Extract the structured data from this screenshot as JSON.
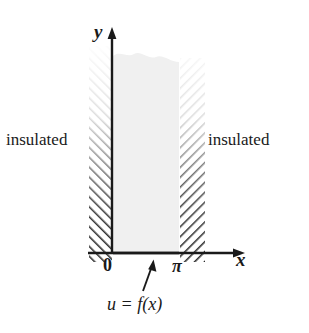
{
  "figure": {
    "labels": {
      "insulated_left": "insulated",
      "insulated_right": "insulated",
      "y_axis": "y",
      "x_axis": "x",
      "origin": "0",
      "pi": "π",
      "boundary_condition": "u = f(x)"
    },
    "colors": {
      "background": "#ffffff",
      "ink": "#1a1a1a",
      "region_fill": "#f0f0f0",
      "hatch": "#2a2a2a"
    },
    "geometry": {
      "x_axis_y": 253,
      "y_axis_x": 112,
      "region_left_x": 113,
      "region_right_x": 179,
      "region_top_y": 52,
      "left_hatch_band": [
        89,
        112
      ],
      "right_hatch_band": [
        179,
        205
      ],
      "left_hatch_top_y": 52,
      "right_hatch_top_y": 68,
      "hatch_bottom_y": 262,
      "x_axis_arrow_x": 240,
      "y_axis_arrow_y": 30
    },
    "annotation_arrow": {
      "from_x": 143,
      "from_y": 291,
      "to_x": 153,
      "to_y": 261
    }
  }
}
